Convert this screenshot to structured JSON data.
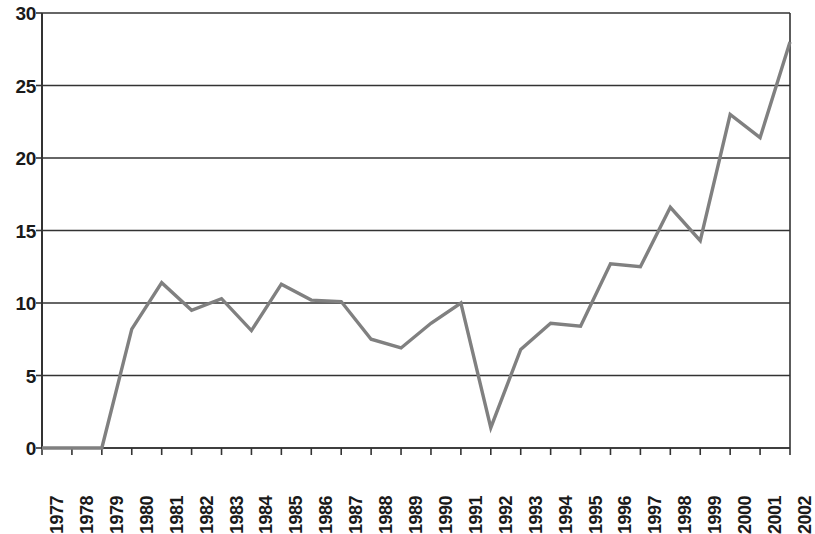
{
  "chart_data": {
    "type": "line",
    "title": "",
    "subtitle": "",
    "xlabel": "",
    "ylabel": "",
    "categories": [
      "1977",
      "1978",
      "1979",
      "1980",
      "1981",
      "1982",
      "1983",
      "1984",
      "1985",
      "1986",
      "1987",
      "1988",
      "1989",
      "1990",
      "1991",
      "1992",
      "1993",
      "1994",
      "1995",
      "1996",
      "1997",
      "1998",
      "1999",
      "2000",
      "2001",
      "2002"
    ],
    "values": [
      0,
      0,
      0,
      8.2,
      11.4,
      9.5,
      10.3,
      8.1,
      11.3,
      10.2,
      10.1,
      7.5,
      6.9,
      8.6,
      10.0,
      1.4,
      6.8,
      8.6,
      8.4,
      12.7,
      12.5,
      16.6,
      14.3,
      23.0,
      21.4,
      28.0
    ],
    "series": [
      {
        "name": "",
        "values": [
          0,
          0,
          0,
          8.2,
          11.4,
          9.5,
          10.3,
          8.1,
          11.3,
          10.2,
          10.1,
          7.5,
          6.9,
          8.6,
          10.0,
          1.4,
          6.8,
          8.6,
          8.4,
          12.7,
          12.5,
          16.6,
          14.3,
          23.0,
          21.4,
          28.0
        ],
        "color": "#808080"
      }
    ],
    "ylim": [
      0,
      30
    ],
    "y_ticks": [
      0,
      5,
      10,
      15,
      20,
      25,
      30
    ],
    "y_tick_labels": [
      "0",
      "5",
      "10",
      "15",
      "20",
      "25",
      "30"
    ],
    "x_tick_labels": [
      "1977",
      "1978",
      "1979",
      "1980",
      "1981",
      "1982",
      "1983",
      "1984",
      "1985",
      "1986",
      "1987",
      "1988",
      "1989",
      "1990",
      "1991",
      "1992",
      "1993",
      "1994",
      "1995",
      "1996",
      "1997",
      "1998",
      "1999",
      "2000",
      "2001",
      "2002"
    ],
    "grid": true,
    "grid_axis": "y",
    "legend": false,
    "legend_position": "none",
    "line_color": "#808080",
    "grid_color": "#333333",
    "axis_color": "#333333",
    "background_color": "#ffffff",
    "x_label_rotation": 90,
    "markers": false,
    "annotations": []
  }
}
